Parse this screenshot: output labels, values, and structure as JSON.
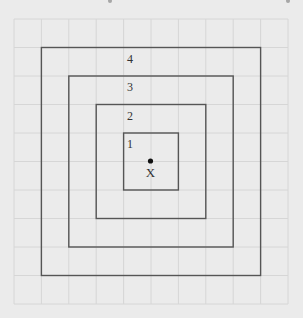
{
  "diagram": {
    "type": "nested-squares-on-grid",
    "colors": {
      "background": "#ebebeb",
      "grid_line": "#d6d6d6",
      "square_stroke": "#555555",
      "text": "#333333",
      "dot": "#111111",
      "top_artifact": "#7a7a7a"
    },
    "grid": {
      "x_lines": [
        14,
        41.4,
        68.8,
        96.2,
        123.6,
        151,
        178.4,
        205.8,
        233.2,
        260.6,
        288
      ],
      "y_lines": [
        19,
        47.5,
        76,
        104.5,
        133,
        161.5,
        190,
        218.5,
        247,
        275.5,
        304
      ],
      "columns": 10,
      "rows": 10
    },
    "squares": [
      {
        "label": "4",
        "x1": 41.4,
        "y1": 47.5,
        "x2": 260.6,
        "y2": 275.5,
        "label_x": 127,
        "label_y": 63
      },
      {
        "label": "3",
        "x1": 68.8,
        "y1": 76,
        "x2": 233.2,
        "y2": 247,
        "label_x": 127,
        "label_y": 91
      },
      {
        "label": "2",
        "x1": 96.2,
        "y1": 104.5,
        "x2": 205.8,
        "y2": 218.5,
        "label_x": 127,
        "label_y": 120
      },
      {
        "label": "1",
        "x1": 123.6,
        "y1": 133,
        "x2": 178.4,
        "y2": 190,
        "label_x": 127,
        "label_y": 148
      }
    ],
    "center": {
      "dot": {
        "cx": 150.5,
        "cy": 161,
        "r": 2.6
      },
      "label": "X",
      "label_x": 150.5,
      "label_y": 177
    },
    "top_artifacts": [
      {
        "cx": 110,
        "cy": 1,
        "r": 2
      },
      {
        "cx": 288,
        "cy": 1,
        "r": 2
      }
    ]
  }
}
